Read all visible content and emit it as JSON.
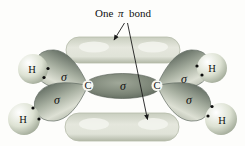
{
  "figure": {
    "title": {
      "pre": "One",
      "pi_symbol": "π",
      "post": "bond"
    },
    "orbital_labels": {
      "sigma": "σ"
    },
    "atom_labels": {
      "carbon": "C",
      "hydrogen": "H"
    },
    "colors": {
      "background": "#fdfdfb",
      "pi_lobe_fill": "#dfe2d7",
      "pi_lobe_edge": "#b5bbaa",
      "pi_lobe_highlight": "#f3f4ee",
      "sigma_lobe_dark": "#6b756a",
      "sigma_lobe_light": "#d8dccf",
      "cc_bond_dark": "#576156",
      "cc_bond_light": "#a0a899",
      "h_sphere_highlight": "#ffffff",
      "h_sphere_rim": "#98a18f",
      "electron_dot": "#0d0d0d",
      "text": "#111111",
      "arrow": "#1a1a1a"
    }
  }
}
